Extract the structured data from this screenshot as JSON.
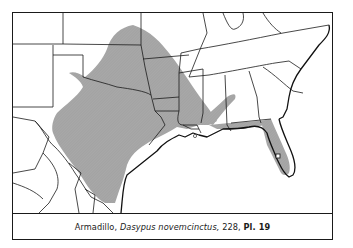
{
  "figure": {
    "caption": {
      "common_name": "Armadillo,",
      "scientific_name": "Dasypus novemcinctus,",
      "page": "228,",
      "plate": "Pl. 19"
    },
    "map": {
      "region": "South-central and southeastern United States",
      "range_fill_color": "#a8a8a8",
      "border_color": "#1a1a1a",
      "background_color": "#ffffff",
      "range_areas": [
        "main-range",
        "florida-range",
        "alabama-georgia-finger"
      ],
      "markers": [
        "florida-locality-square",
        "louisiana-locality-dot"
      ]
    }
  }
}
